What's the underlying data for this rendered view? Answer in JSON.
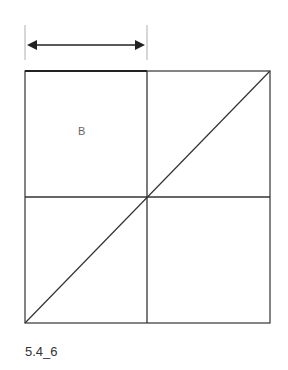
{
  "figure": {
    "region_label": "B",
    "caption": "5.4_6",
    "colors": {
      "line": "#222222",
      "label": "#666666"
    }
  }
}
